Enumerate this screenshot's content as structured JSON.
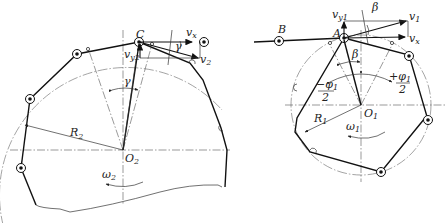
{
  "diagram": {
    "type": "sprocket-chain velocity diagram",
    "left_figure": {
      "center_label": "O",
      "center_sub": "2",
      "radius_label": "R",
      "radius_sub": "2",
      "omega_label": "ω",
      "omega_sub": "2",
      "point_label": "C",
      "gamma_label": "γ",
      "vx_label": "v",
      "vx_sub": "x",
      "vy_label": "v",
      "vy_sub": "y2",
      "v_label": "v",
      "v_sub": "2",
      "angle_label": "γ"
    },
    "right_figure": {
      "center_label": "O",
      "center_sub": "1",
      "radius_label": "R",
      "radius_sub": "1",
      "omega_label": "ω",
      "omega_sub": "1",
      "point_a_label": "A",
      "point_b_label": "B",
      "beta_label": "β",
      "beta_top_label": "β",
      "vx_label": "v",
      "vx_sub": "x",
      "vy_label": "v",
      "vy_sub": "y1",
      "v_label": "v",
      "v_sub": "1",
      "phi_left_sign": "−",
      "phi_right_sign": "+",
      "phi_num": "φ",
      "phi_num_sub": "1",
      "phi_den": "2"
    }
  }
}
